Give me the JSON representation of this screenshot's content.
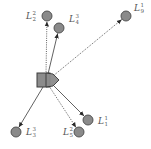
{
  "colors": {
    "node_fill": "#8a8a8a",
    "node_stroke": "#4a4a4a",
    "edge": "#3a3a3a",
    "robot_fill": "#8c8c8c",
    "robot_stroke": "#3c3c3c"
  },
  "robot": {
    "name": "robot",
    "shapes": [
      "square",
      "pentagon"
    ]
  },
  "landmarks": [
    {
      "id": "L2_2",
      "base": "L",
      "sup": "2",
      "sub": "2",
      "line": "dotted"
    },
    {
      "id": "L4_3",
      "base": "L",
      "sup": "3",
      "sub": "4",
      "line": "solid"
    },
    {
      "id": "L9_1",
      "base": "L",
      "sup": "1",
      "sub": "9",
      "line": "dotted"
    },
    {
      "id": "L1_1",
      "base": "L",
      "sup": "1",
      "sub": "1",
      "line": "solid"
    },
    {
      "id": "L5_2",
      "base": "L",
      "sup": "2",
      "sub": "5",
      "line": "dotted"
    },
    {
      "id": "L3_3",
      "base": "L",
      "sup": "3",
      "sub": "3",
      "line": "solid"
    }
  ]
}
